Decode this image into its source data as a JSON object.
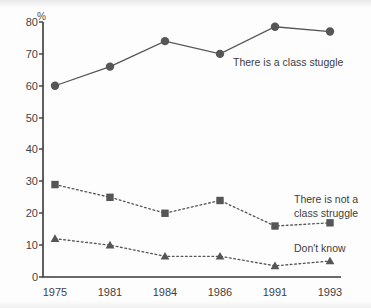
{
  "chart_data": {
    "type": "line",
    "title": "",
    "subtitle": "",
    "xlabel": "",
    "ylabel": "%",
    "y_unit_label": "%",
    "categories": [
      "1975",
      "1981",
      "1984",
      "1986",
      "1991",
      "1993"
    ],
    "x": [
      1975,
      1981,
      1984,
      1986,
      1991,
      1993
    ],
    "ylim": [
      0,
      80
    ],
    "yticks": [
      0,
      10,
      20,
      30,
      40,
      50,
      60,
      70,
      80
    ],
    "ytick_labels": [
      "0",
      "10",
      "20",
      "30",
      "40",
      "50",
      "60",
      "70",
      "80"
    ],
    "xtick_labels": [
      "1975",
      "1981",
      "1984",
      "1986",
      "1991",
      "1993"
    ],
    "grid": false,
    "legend_position": "inline-annotations",
    "series": [
      {
        "name": "There is a class stuggle",
        "label": "There is a class stuggle",
        "marker": "circle",
        "linestyle": "solid",
        "color": "#565656",
        "values": [
          60,
          66,
          74,
          70,
          78.5,
          77
        ]
      },
      {
        "name": "There is not a class struggle",
        "label": "There is not a\nclass struggle",
        "label_line1": "There is not a",
        "label_line2": "class struggle",
        "marker": "square",
        "linestyle": "dotted",
        "color": "#565656",
        "values": [
          29,
          25,
          20,
          24,
          16,
          17
        ]
      },
      {
        "name": "Don't know",
        "label": "Don't know",
        "marker": "triangle",
        "linestyle": "dotted",
        "color": "#565656",
        "values": [
          12,
          10,
          6.5,
          6.5,
          3.5,
          5
        ]
      }
    ]
  },
  "axis": {
    "unit": "%",
    "y_labels": [
      "80",
      "70",
      "60",
      "50",
      "40",
      "30",
      "20",
      "10",
      "0"
    ],
    "x_labels": [
      "1975",
      "1981",
      "1984",
      "1986",
      "1991",
      "1993"
    ]
  },
  "annotations": {
    "series1": "There is a class stuggle",
    "series2_line1": "There is not a",
    "series2_line2": "class struggle",
    "series3": "Don't know"
  },
  "colors": {
    "ink": "#565656",
    "axis": "#3a3a3a",
    "background": "#fdfdfd"
  }
}
